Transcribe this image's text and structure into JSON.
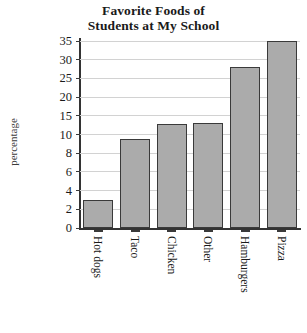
{
  "chart_data": {
    "type": "bar",
    "title": "Favorite Foods of Students at My School",
    "title_lines": [
      "Favorite Foods of",
      "Students at My School"
    ],
    "xlabel": "",
    "ylabel": "percentage",
    "categories": [
      "Hot dogs",
      "Taco",
      "Chicken",
      "Other",
      "Hamburgers",
      "Pizza"
    ],
    "values": [
      3,
      9.5,
      12.8,
      13,
      28,
      35
    ],
    "ytick_labels": [
      "0",
      "2",
      "4",
      "6",
      "8",
      "10",
      "15",
      "20",
      "25",
      "30",
      "35"
    ],
    "ytick_values": [
      0,
      2,
      4,
      6,
      8,
      10,
      15,
      20,
      25,
      30,
      35
    ],
    "ylim": [
      0,
      35
    ],
    "axis_scale": "non-linear-evenly-spaced-ticks",
    "grid": true,
    "legend": false,
    "bar_fill_color": "#ababab",
    "bar_border_color": "#3a3a3a",
    "gridline_color": "#d2d2d2",
    "axis_color": "#333333",
    "background_color": "#ffffff"
  }
}
